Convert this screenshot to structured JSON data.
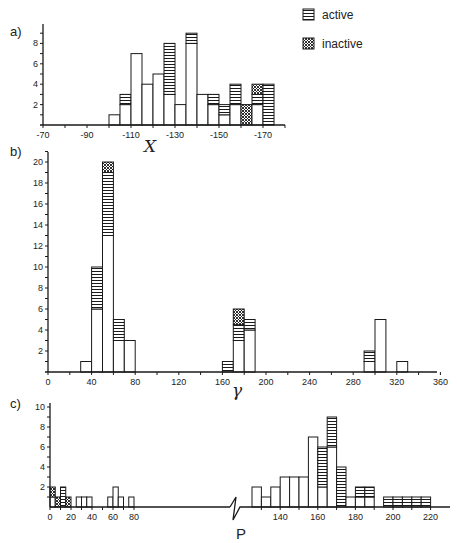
{
  "legend": {
    "items": [
      {
        "label": "active",
        "pattern": "hlines"
      },
      {
        "label": "inactive",
        "pattern": "crosshatch"
      }
    ]
  },
  "colors": {
    "ink": "#1a1a1a",
    "background": "#ffffff"
  },
  "chart_data": [
    {
      "panel": "a)",
      "type": "bar",
      "stacked": true,
      "xlabel": "X",
      "ylabel": "",
      "xticks": [
        "-70",
        "-90",
        "-110",
        "-130",
        "-150",
        "-170"
      ],
      "yticks": [
        "2",
        "4",
        "6",
        "8"
      ],
      "xlim": [
        -70,
        -180
      ],
      "ylim": [
        0,
        9.5
      ],
      "bin_width": 5,
      "bins": [
        {
          "from": -100,
          "to": -105,
          "white": 1,
          "active": 0,
          "inactive": 0
        },
        {
          "from": -105,
          "to": -110,
          "white": 2,
          "active": 1,
          "inactive": 0
        },
        {
          "from": -110,
          "to": -115,
          "white": 7,
          "active": 0,
          "inactive": 0
        },
        {
          "from": -115,
          "to": -120,
          "white": 4,
          "active": 0,
          "inactive": 0
        },
        {
          "from": -120,
          "to": -125,
          "white": 5,
          "active": 0,
          "inactive": 0
        },
        {
          "from": -125,
          "to": -130,
          "white": 3,
          "active": 5,
          "inactive": 0
        },
        {
          "from": -130,
          "to": -135,
          "white": 2,
          "active": 0,
          "inactive": 0
        },
        {
          "from": -135,
          "to": -140,
          "white": 8,
          "active": 1,
          "inactive": 0
        },
        {
          "from": -140,
          "to": -145,
          "white": 3,
          "active": 0,
          "inactive": 0
        },
        {
          "from": -145,
          "to": -150,
          "white": 2,
          "active": 1,
          "inactive": 0
        },
        {
          "from": -150,
          "to": -155,
          "white": 1,
          "active": 1,
          "inactive": 0
        },
        {
          "from": -155,
          "to": -160,
          "white": 2,
          "active": 2,
          "inactive": 0
        },
        {
          "from": -160,
          "to": -165,
          "white": 0,
          "active": 0,
          "inactive": 2
        },
        {
          "from": -165,
          "to": -170,
          "white": 2,
          "active": 1,
          "inactive": 1
        },
        {
          "from": -170,
          "to": -175,
          "white": 0,
          "active": 4,
          "inactive": 0
        }
      ]
    },
    {
      "panel": "b)",
      "type": "bar",
      "stacked": true,
      "xlabel": "γ",
      "ylabel": "",
      "xticks": [
        "0",
        "40",
        "80",
        "120",
        "160",
        "200",
        "240",
        "280",
        "320",
        "360"
      ],
      "yticks": [
        "2",
        "4",
        "6",
        "8",
        "10",
        "12",
        "14",
        "16",
        "18",
        "20"
      ],
      "xlim": [
        0,
        370
      ],
      "ylim": [
        0,
        21
      ],
      "bin_width": 10,
      "bins": [
        {
          "from": 30,
          "to": 40,
          "white": 1,
          "active": 0,
          "inactive": 0
        },
        {
          "from": 40,
          "to": 50,
          "white": 6,
          "active": 4,
          "inactive": 0
        },
        {
          "from": 50,
          "to": 60,
          "white": 13,
          "active": 6,
          "inactive": 1
        },
        {
          "from": 60,
          "to": 70,
          "white": 3,
          "active": 2,
          "inactive": 0
        },
        {
          "from": 70,
          "to": 80,
          "white": 3,
          "active": 0,
          "inactive": 0
        },
        {
          "from": 160,
          "to": 170,
          "white": 0,
          "active": 1,
          "inactive": 0
        },
        {
          "from": 170,
          "to": 180,
          "white": 3,
          "active": 1.5,
          "inactive": 1.5
        },
        {
          "from": 180,
          "to": 190,
          "white": 4,
          "active": 1,
          "inactive": 0
        },
        {
          "from": 290,
          "to": 300,
          "white": 1,
          "active": 1,
          "inactive": 0
        },
        {
          "from": 300,
          "to": 310,
          "white": 5,
          "active": 0,
          "inactive": 0
        },
        {
          "from": 320,
          "to": 330,
          "white": 1,
          "active": 0,
          "inactive": 0
        }
      ]
    },
    {
      "panel": "c)",
      "type": "bar",
      "stacked": true,
      "xlabel": "P",
      "ylabel": "",
      "xticks": [
        "0",
        "20",
        "40",
        "60",
        "80",
        "140",
        "160",
        "180",
        "200",
        "220"
      ],
      "yticks": [
        "2",
        "4",
        "6",
        "8",
        "10"
      ],
      "axis_break": [
        90,
        120
      ],
      "ylim": [
        0,
        10
      ],
      "bin_width": 5,
      "bins": [
        {
          "from": 0,
          "to": 5,
          "white": 1,
          "active": 0,
          "inactive": 1
        },
        {
          "from": 5,
          "to": 10,
          "white": 0,
          "active": 0,
          "inactive": 1
        },
        {
          "from": 10,
          "to": 15,
          "white": 0,
          "active": 2,
          "inactive": 0
        },
        {
          "from": 15,
          "to": 20,
          "white": 0,
          "active": 0,
          "inactive": 1
        },
        {
          "from": 25,
          "to": 30,
          "white": 1,
          "active": 0,
          "inactive": 0
        },
        {
          "from": 30,
          "to": 35,
          "white": 1,
          "active": 0,
          "inactive": 0
        },
        {
          "from": 35,
          "to": 40,
          "white": 1,
          "active": 0,
          "inactive": 0
        },
        {
          "from": 55,
          "to": 60,
          "white": 1,
          "active": 0,
          "inactive": 0
        },
        {
          "from": 60,
          "to": 65,
          "white": 2,
          "active": 0,
          "inactive": 0
        },
        {
          "from": 65,
          "to": 70,
          "white": 1,
          "active": 0,
          "inactive": 0
        },
        {
          "from": 75,
          "to": 80,
          "white": 1,
          "active": 0,
          "inactive": 0
        },
        {
          "from": 125,
          "to": 130,
          "white": 2,
          "active": 0,
          "inactive": 0
        },
        {
          "from": 130,
          "to": 135,
          "white": 1,
          "active": 0,
          "inactive": 0
        },
        {
          "from": 135,
          "to": 140,
          "white": 2,
          "active": 0,
          "inactive": 0
        },
        {
          "from": 140,
          "to": 145,
          "white": 3,
          "active": 0,
          "inactive": 0
        },
        {
          "from": 145,
          "to": 150,
          "white": 3,
          "active": 0,
          "inactive": 0
        },
        {
          "from": 150,
          "to": 155,
          "white": 3,
          "active": 0,
          "inactive": 0
        },
        {
          "from": 155,
          "to": 160,
          "white": 7,
          "active": 0,
          "inactive": 0
        },
        {
          "from": 160,
          "to": 165,
          "white": 2,
          "active": 4,
          "inactive": 0
        },
        {
          "from": 165,
          "to": 170,
          "white": 6,
          "active": 3,
          "inactive": 0
        },
        {
          "from": 170,
          "to": 175,
          "white": 0,
          "active": 4,
          "inactive": 0
        },
        {
          "from": 175,
          "to": 180,
          "white": 1,
          "active": 0,
          "inactive": 0
        },
        {
          "from": 180,
          "to": 185,
          "white": 1,
          "active": 1,
          "inactive": 0
        },
        {
          "from": 185,
          "to": 190,
          "white": 1,
          "active": 1,
          "inactive": 0
        },
        {
          "from": 195,
          "to": 200,
          "white": 0,
          "active": 1,
          "inactive": 0
        },
        {
          "from": 200,
          "to": 205,
          "white": 0,
          "active": 1,
          "inactive": 0
        },
        {
          "from": 205,
          "to": 210,
          "white": 0,
          "active": 1,
          "inactive": 0
        },
        {
          "from": 210,
          "to": 215,
          "white": 0,
          "active": 1,
          "inactive": 0
        },
        {
          "from": 215,
          "to": 220,
          "white": 0,
          "active": 1,
          "inactive": 0
        }
      ]
    }
  ]
}
